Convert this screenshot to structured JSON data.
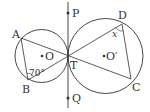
{
  "figure": {
    "labels": {
      "A": "A",
      "B": "B",
      "C": "C",
      "D": "D",
      "P": "P",
      "Q": "Q",
      "T": "T",
      "O": "O",
      "O_prime": "O′"
    },
    "angles": {
      "angle_B": "70°",
      "angle_D": "x"
    },
    "colors": {
      "stroke": "#333333",
      "background": "#ffffff"
    }
  }
}
